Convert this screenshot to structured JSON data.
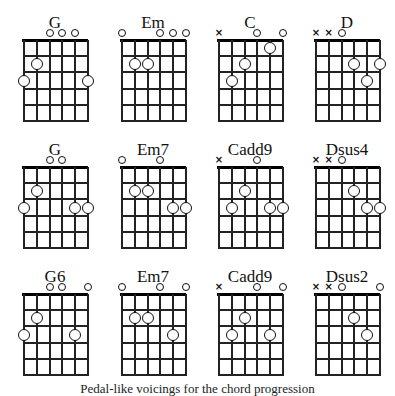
{
  "figure": {
    "caption": "Pedal-like voicings for the chord progression",
    "string_order": "low E (6) to high e (1), left to right",
    "frets_shown": 5,
    "legend": {
      "open_string": "o",
      "muted_string": "x",
      "fretted_note": "circle"
    }
  },
  "chords": [
    {
      "name": "G",
      "row": 0,
      "col": 0,
      "frets": [
        3,
        2,
        0,
        0,
        0,
        3
      ]
    },
    {
      "name": "Em",
      "row": 0,
      "col": 1,
      "frets": [
        0,
        2,
        2,
        0,
        0,
        0
      ]
    },
    {
      "name": "C",
      "row": 0,
      "col": 2,
      "frets": [
        "x",
        3,
        2,
        0,
        1,
        0
      ]
    },
    {
      "name": "D",
      "row": 0,
      "col": 3,
      "frets": [
        "x",
        "x",
        0,
        2,
        3,
        2
      ]
    },
    {
      "name": "G",
      "row": 1,
      "col": 0,
      "frets": [
        3,
        2,
        0,
        0,
        3,
        3
      ]
    },
    {
      "name": "Em7",
      "row": 1,
      "col": 1,
      "frets": [
        0,
        2,
        2,
        0,
        3,
        3
      ]
    },
    {
      "name": "Cadd9",
      "row": 1,
      "col": 2,
      "frets": [
        "x",
        3,
        2,
        0,
        3,
        3
      ]
    },
    {
      "name": "Dsus4",
      "row": 1,
      "col": 3,
      "frets": [
        "x",
        "x",
        0,
        2,
        3,
        3
      ]
    },
    {
      "name": "G6",
      "row": 2,
      "col": 0,
      "frets": [
        3,
        2,
        0,
        0,
        3,
        0
      ]
    },
    {
      "name": "Em7",
      "row": 2,
      "col": 1,
      "frets": [
        0,
        2,
        2,
        0,
        3,
        0
      ]
    },
    {
      "name": "Cadd9",
      "row": 2,
      "col": 2,
      "frets": [
        "x",
        3,
        2,
        0,
        3,
        0
      ]
    },
    {
      "name": "Dsus2",
      "row": 2,
      "col": 3,
      "frets": [
        "x",
        "x",
        0,
        2,
        3,
        0
      ]
    }
  ],
  "layout": {
    "col_x": [
      23,
      121,
      218,
      315
    ],
    "row_y": [
      40,
      167,
      294
    ],
    "string_spacing": 12.8,
    "fret_spacing": 16.2
  }
}
